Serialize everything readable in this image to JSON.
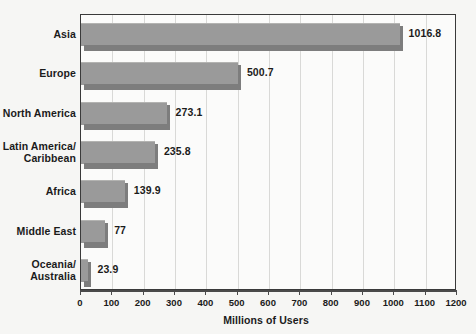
{
  "chart_data": {
    "type": "bar",
    "orientation": "horizontal",
    "title": "",
    "xlabel": "Millions of Users",
    "ylabel": "",
    "xlim": [
      0,
      1200
    ],
    "grid": true,
    "legend": "none",
    "categories": [
      "Asia",
      "Europe",
      "North America",
      "Latin America/\nCaribbean",
      "Africa",
      "Middle East",
      "Oceania/\nAustralia"
    ],
    "values": [
      1016.8,
      500.7,
      273.1,
      235.8,
      139.9,
      77,
      23.9
    ],
    "value_labels": [
      "1016.8",
      "500.7",
      "273.1",
      "235.8",
      "139.9",
      "77",
      "23.9"
    ],
    "xticks": [
      0,
      100,
      200,
      300,
      400,
      500,
      600,
      700,
      800,
      900,
      1000,
      1100,
      1200
    ],
    "xtick_labels": [
      "0",
      "100",
      "200",
      "300",
      "400",
      "500",
      "600",
      "700",
      "800",
      "900",
      "1000",
      "1100",
      "1200"
    ],
    "bar_color": "#9a9a9a",
    "bar_shadow_color": "#7d7d7d",
    "plot_background": "#fbfbfa",
    "page_background": "#f6f6f4",
    "gridline_color": "#d9d9d7",
    "text_color": "#1b1b1b"
  },
  "category_lines": [
    [
      "Asia"
    ],
    [
      "Europe"
    ],
    [
      "North America"
    ],
    [
      "Latin America/",
      "Caribbean"
    ],
    [
      "Africa"
    ],
    [
      "Middle East"
    ],
    [
      "Oceania/",
      "Australia"
    ]
  ],
  "axis": {
    "title": "Millions of Users"
  }
}
